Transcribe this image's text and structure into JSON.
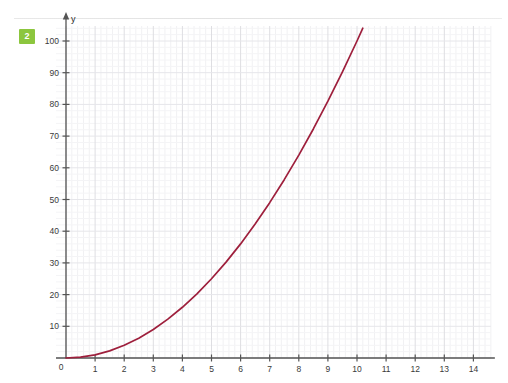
{
  "badge": {
    "label": "2",
    "color": "#8cc63e"
  },
  "chart_data": {
    "type": "line",
    "title": "",
    "subtitle": "",
    "xlabel": "",
    "ylabel": "y",
    "xlim": [
      0,
      14.6
    ],
    "ylim": [
      0,
      106
    ],
    "grid": true,
    "minor_grid": true,
    "legend": "none",
    "x_ticks": [
      0,
      1,
      2,
      3,
      4,
      5,
      6,
      7,
      8,
      9,
      10,
      11,
      12,
      13,
      14
    ],
    "x_tick_labels": [
      "0",
      "1",
      "2",
      "3",
      "4",
      "5",
      "6",
      "7",
      "8",
      "9",
      "10",
      "11",
      "12",
      "13",
      "14"
    ],
    "y_ticks": [
      0,
      10,
      20,
      30,
      40,
      50,
      60,
      70,
      80,
      90,
      100
    ],
    "y_tick_labels": [
      "0",
      "10",
      "20",
      "30",
      "40",
      "50",
      "60",
      "70",
      "80",
      "90",
      "100"
    ],
    "series": [
      {
        "name": "y = x²",
        "color": "#9e1f3c",
        "x": [
          0,
          0.5,
          1,
          1.5,
          2,
          2.5,
          3,
          3.5,
          4,
          4.5,
          5,
          5.5,
          6,
          6.5,
          7,
          7.5,
          8,
          8.5,
          9,
          9.5,
          10,
          10.2
        ],
        "values": [
          0,
          0.25,
          1,
          2.25,
          4,
          6.25,
          9,
          12.25,
          16,
          20.25,
          25,
          30.25,
          36,
          42.25,
          49,
          56.25,
          64,
          72.25,
          81,
          90.25,
          100,
          104.04
        ]
      }
    ],
    "annotations": []
  },
  "axes": {
    "y_axis_name": "y",
    "x_axis_name": ""
  }
}
